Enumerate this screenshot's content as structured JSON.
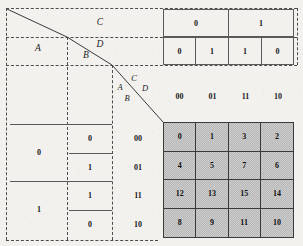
{
  "figure": {
    "variables": [
      "A",
      "B",
      "C",
      "D"
    ]
  },
  "colors": {
    "paper": "#f2f1ee",
    "ink": "#1a1a1a",
    "dashed_line": "#4c4c4c",
    "solid_line": "#5a5a5a",
    "kmap_fill": "#b5b5b5",
    "kmap_border": "#3a3a3a"
  },
  "top_left_labels": {
    "a": "A",
    "b": "B",
    "c": "C",
    "d": "D"
  },
  "corner_labels": {
    "a": "A",
    "b": "B",
    "c": "C",
    "d": "D"
  },
  "top_truth": {
    "c_row": [
      "0",
      "1"
    ],
    "d_row": [
      "0",
      "1",
      "1",
      "0"
    ]
  },
  "column_headers": [
    "00",
    "01",
    "11",
    "10"
  ],
  "row_headers": [
    "00",
    "01",
    "11",
    "10"
  ],
  "left_truth": {
    "a_column": [
      "0",
      "1"
    ],
    "b_column": [
      "0",
      "1",
      "1",
      "0"
    ]
  },
  "kmap": {
    "cells": [
      [
        "0",
        "1",
        "3",
        "2"
      ],
      [
        "4",
        "5",
        "7",
        "6"
      ],
      [
        "12",
        "13",
        "15",
        "14"
      ],
      [
        "8",
        "9",
        "11",
        "10"
      ]
    ]
  }
}
